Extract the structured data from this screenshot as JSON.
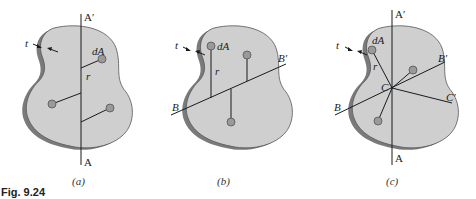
{
  "figure_label": "Fig. 9.24",
  "panels": [
    {
      "caption": "(a)",
      "labels": {
        "axis_top": "A′",
        "axis_bottom": "A",
        "thickness": "t",
        "element": "dA",
        "distance": "r"
      }
    },
    {
      "caption": "(b)",
      "labels": {
        "axis_left": "B",
        "axis_right": "B′",
        "thickness": "t",
        "element": "dA",
        "distance": "r"
      }
    },
    {
      "caption": "(c)",
      "labels": {
        "axis_top": "A′",
        "axis_bottom": "A",
        "axis_b_left": "B",
        "axis_b_right": "B′",
        "axis_c_right": "C′",
        "center": "C",
        "thickness": "t",
        "element": "dA",
        "distance": "r"
      }
    }
  ],
  "colors": {
    "plate_face": "#cfcfcf",
    "plate_edge": "#7a7a7a",
    "element_dot": "#9a9a9a",
    "line": "#1a1a1a"
  }
}
